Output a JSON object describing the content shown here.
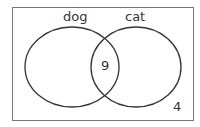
{
  "venn": {
    "sets": [
      {
        "label": "dog"
      },
      {
        "label": "cat"
      }
    ],
    "regions": {
      "dog_only": "",
      "cat_only": "",
      "both": "9",
      "neither": "4"
    },
    "colors": {
      "stroke": "#333333",
      "border": "#666666",
      "background": "#ffffff"
    }
  }
}
